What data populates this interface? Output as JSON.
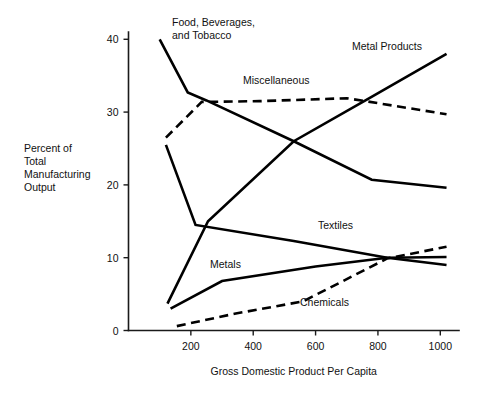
{
  "chart_data": {
    "type": "line",
    "title": "",
    "xlabel": "Gross Domestic Product Per Capita",
    "ylabel": "Percent of Total Manufacturing Output",
    "ylabel_lines": [
      "Percent of",
      "Total",
      "Manufacturing",
      "Output"
    ],
    "xlim": [
      0,
      1060
    ],
    "ylim": [
      0,
      41
    ],
    "xticks": [
      200,
      400,
      600,
      800,
      1000
    ],
    "xtick_labels": [
      "200",
      "400",
      "600",
      "800",
      "1000"
    ],
    "yticks": [
      0,
      10,
      20,
      30,
      40
    ],
    "ytick_labels": [
      "0",
      "10",
      "20",
      "30",
      "40"
    ],
    "grid": false,
    "legend": "inline-labels",
    "series": [
      {
        "name": "Food, Beverages, and Tobacco",
        "label_lines": [
          "Food, Beverages,",
          "and Tobacco"
        ],
        "style": "solid",
        "x": [
          100,
          190,
          250,
          530,
          780,
          1020
        ],
        "y": [
          40.0,
          32.7,
          31.6,
          26.0,
          20.7,
          19.6
        ]
      },
      {
        "name": "Miscellaneous",
        "label_lines": [
          "Miscellaneous"
        ],
        "style": "dashed",
        "x": [
          120,
          235,
          420,
          700,
          760,
          1020
        ],
        "y": [
          26.5,
          31.4,
          31.5,
          31.9,
          31.5,
          29.7
        ]
      },
      {
        "name": "Metal Products",
        "label_lines": [
          "Metal Products"
        ],
        "style": "solid",
        "x": [
          125,
          255,
          530,
          760,
          1020
        ],
        "y": [
          3.7,
          15.0,
          26.0,
          31.6,
          38.0
        ]
      },
      {
        "name": "Textiles",
        "label_lines": [
          "Textiles"
        ],
        "style": "solid",
        "x": [
          120,
          215,
          530,
          830,
          1020
        ],
        "y": [
          25.5,
          14.5,
          12.3,
          10.0,
          9.0
        ]
      },
      {
        "name": "Metals",
        "label_lines": [
          "Metals"
        ],
        "style": "solid",
        "x": [
          135,
          300,
          600,
          830,
          1020
        ],
        "y": [
          3.0,
          6.8,
          8.8,
          10.0,
          10.1
        ]
      },
      {
        "name": "Chemicals",
        "label_lines": [
          "Chemicals"
        ],
        "style": "dashed",
        "x": [
          155,
          340,
          560,
          830,
          1020
        ],
        "y": [
          0.6,
          2.3,
          4.0,
          9.9,
          11.5
        ]
      }
    ],
    "series_labels": [
      {
        "name": "Food, Beverages, and Tobacco",
        "lines": [
          "Food, Beverages,",
          "and Tobacco"
        ],
        "x_px": 172,
        "y_px": 26
      },
      {
        "name": "Metal Products",
        "lines": [
          "Metal Products"
        ],
        "x_px": 352,
        "y_px": 50
      },
      {
        "name": "Miscellaneous",
        "lines": [
          "Miscellaneous"
        ],
        "x_px": 243,
        "y_px": 84
      },
      {
        "name": "Textiles",
        "lines": [
          "Textiles"
        ],
        "x_px": 318,
        "y_px": 229
      },
      {
        "name": "Metals",
        "lines": [
          "Metals"
        ],
        "x_px": 210,
        "y_px": 268
      },
      {
        "name": "Chemicals",
        "lines": [
          "Chemicals"
        ],
        "x_px": 300,
        "y_px": 306
      }
    ]
  }
}
